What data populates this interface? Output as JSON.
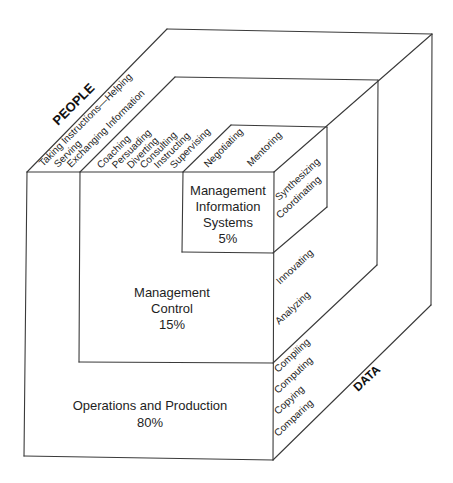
{
  "diagram": {
    "axes": {
      "people": "PEOPLE",
      "data": "DATA"
    },
    "people_functions": [
      "Taking Instructions—Helping",
      "Serving",
      "Exchanging Information",
      "Coaching",
      "Persuading",
      "Diverting",
      "Consulting",
      "Instructing",
      "Supervising",
      "Negotiating",
      "Mentoring"
    ],
    "data_functions": [
      "Synthesizing",
      "Coordinating",
      "Innovating",
      "Analyzing",
      "Compiling",
      "Computing",
      "Copying",
      "Comparing"
    ],
    "levels": {
      "mis": {
        "line1": "Management",
        "line2": "Information",
        "line3": "Systems",
        "share": "5%"
      },
      "control": {
        "line1": "Management",
        "line2": "Control",
        "share": "15%"
      },
      "operations": {
        "line1": "Operations and Production",
        "share": "80%"
      }
    }
  }
}
